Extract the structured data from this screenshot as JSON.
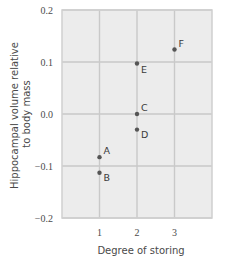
{
  "chart_data": {
    "type": "scatter",
    "title": "",
    "xlabel": "Degree of storing",
    "ylabel": "Hippocampal volume relative to body mass",
    "ylabel_lines": [
      "Hippocampal volume relative",
      "to body mass"
    ],
    "xlim": [
      0,
      4
    ],
    "ylim": [
      -0.2,
      0.2
    ],
    "x_ticks": [
      1,
      2,
      3
    ],
    "x_tick_labels": [
      "1",
      "2",
      "3"
    ],
    "y_ticks": [
      0.2,
      0.1,
      0.0,
      -0.1,
      -0.2
    ],
    "y_tick_labels": [
      "0.2",
      "0.1",
      "0.0",
      "−0.1",
      "−0.2"
    ],
    "grid": true,
    "legend": null,
    "points": [
      {
        "label": "A",
        "x": 1,
        "y": -0.083
      },
      {
        "label": "B",
        "x": 1,
        "y": -0.113
      },
      {
        "label": "C",
        "x": 2,
        "y": 0.0
      },
      {
        "label": "D",
        "x": 2,
        "y": -0.03
      },
      {
        "label": "E",
        "x": 2,
        "y": 0.097
      },
      {
        "label": "F",
        "x": 3,
        "y": 0.124
      }
    ]
  },
  "colors": {
    "plot_background": "#ececec",
    "gridline": "#c9c9c9",
    "frame": "#cfcfcf",
    "point": "#555555",
    "text": "#4a4a4a"
  }
}
